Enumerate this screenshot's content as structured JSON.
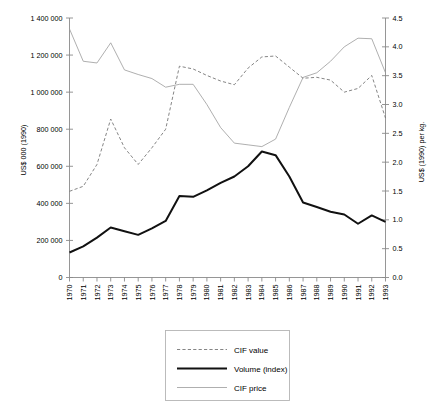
{
  "chart_data": {
    "type": "line",
    "title": "",
    "xlabel": "",
    "ylabel": "US$ 000 (1990)",
    "y2label": "US$ (1990) per kg.",
    "grid": false,
    "legend_position": "bottom-center",
    "ylim": [
      0,
      1400000
    ],
    "y2lim": [
      0.0,
      4.5
    ],
    "xlim": [
      "1970",
      "1993"
    ],
    "categories": [
      "1970",
      "1971",
      "1972",
      "1973",
      "1974",
      "1975",
      "1976",
      "1977",
      "1978",
      "1979",
      "1980",
      "1981",
      "1982",
      "1983",
      "1984",
      "1985",
      "1986",
      "1987",
      "1988",
      "1989",
      "1990",
      "1991",
      "1992",
      "1993"
    ],
    "y_tick_labels": [
      "0",
      "200 000",
      "400 000",
      "600 000",
      "800 000",
      "1 000 000",
      "1 200 000",
      "1 400 000"
    ],
    "y_tick_values": [
      0,
      200000,
      400000,
      600000,
      800000,
      1000000,
      1200000,
      1400000
    ],
    "y2_tick_labels": [
      "0.0",
      "0.5",
      "1.0",
      "1.5",
      "2.0",
      "2.5",
      "3.0",
      "3.5",
      "4.0",
      "4.5"
    ],
    "y2_tick_values": [
      0.0,
      0.5,
      1.0,
      1.5,
      2.0,
      2.5,
      3.0,
      3.5,
      4.0,
      4.5
    ],
    "series": [
      {
        "name": "CIF value",
        "axis": "left",
        "style": "dashed",
        "color": "#777777",
        "unit": "US$ 000 (1990)",
        "values": [
          465000,
          492000,
          610000,
          855000,
          700000,
          610000,
          700000,
          800000,
          1140000,
          1125000,
          1090000,
          1060000,
          1040000,
          1130000,
          1190000,
          1195000,
          1135000,
          1075000,
          1080000,
          1065000,
          1000000,
          1020000,
          1090000,
          860000
        ]
      },
      {
        "name": "Volume (index)",
        "axis": "left",
        "style": "thick-solid",
        "color": "#111111",
        "unit": "US$ 000 (1990)",
        "values": [
          135000,
          168000,
          215000,
          270000,
          250000,
          230000,
          265000,
          305000,
          440000,
          435000,
          470000,
          510000,
          545000,
          600000,
          680000,
          660000,
          545000,
          405000,
          380000,
          355000,
          340000,
          290000,
          335000,
          300000
        ]
      },
      {
        "name": "CIF price",
        "axis": "right",
        "style": "thin-solid",
        "color": "#9a9a9a",
        "unit": "US$ (1990) per kg.",
        "values": [
          4.31,
          3.75,
          3.72,
          4.07,
          3.6,
          3.52,
          3.45,
          3.3,
          3.35,
          3.35,
          3.0,
          2.6,
          2.33,
          2.3,
          2.27,
          2.4,
          2.95,
          3.47,
          3.55,
          3.75,
          4.0,
          4.15,
          4.14,
          3.55
        ]
      }
    ]
  },
  "legend": {
    "items": [
      {
        "label": "CIF value",
        "style": "dashed"
      },
      {
        "label": "Volume (index)",
        "style": "thick-solid"
      },
      {
        "label": "CIF price",
        "style": "thin-solid"
      }
    ]
  }
}
